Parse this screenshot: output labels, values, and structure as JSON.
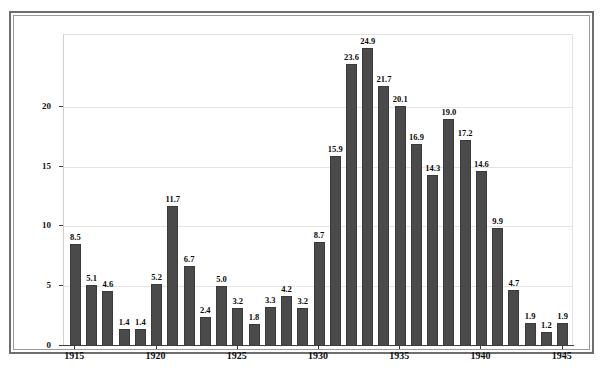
{
  "chart_data": {
    "type": "bar",
    "title": "",
    "subtitle": "",
    "xlabel": "",
    "ylabel": "Percent unemployed",
    "ylim": [
      0,
      26
    ],
    "xlim": [
      1914.3,
      1945.7
    ],
    "grid": true,
    "legend": null,
    "bar_color": "#4a4a4a",
    "categories": [
      "1915",
      "1916",
      "1917",
      "1918",
      "1919",
      "1920",
      "1921",
      "1922",
      "1923",
      "1924",
      "1925",
      "1926",
      "1927",
      "1928",
      "1929",
      "1930",
      "1931",
      "1932",
      "1933",
      "1934",
      "1935",
      "1936",
      "1937",
      "1938",
      "1939",
      "1940",
      "1941",
      "1942",
      "1943",
      "1944",
      "1945"
    ],
    "values": [
      8.5,
      5.1,
      4.6,
      1.4,
      1.4,
      5.2,
      11.7,
      6.7,
      2.4,
      5.0,
      3.2,
      1.8,
      3.3,
      4.2,
      3.2,
      8.7,
      15.9,
      23.6,
      24.9,
      21.7,
      20.1,
      16.9,
      14.3,
      19.0,
      17.2,
      14.6,
      9.9,
      4.7,
      1.9,
      1.2,
      1.9
    ],
    "data_labels": [
      "8.5",
      "5.1",
      "4.6",
      "1.4",
      "1.4",
      "5.2",
      "11.7",
      "6.7",
      "2.4",
      "5.0",
      "3.2",
      "1.8",
      "3.3",
      "4.2",
      "3.2",
      "8.7",
      "15.9",
      "23.6",
      "24.9",
      "21.7",
      "20.1",
      "16.9",
      "14.3",
      "19.0",
      "17.2",
      "14.6",
      "9.9",
      "4.7",
      "1.9",
      "1.2",
      "1.9"
    ],
    "yticks": [
      0,
      5,
      10,
      15,
      20
    ],
    "ytick_labels": [
      "0",
      "5",
      "10",
      "15",
      "20"
    ],
    "xticks": [
      1915,
      1920,
      1925,
      1930,
      1935,
      1940,
      1945
    ],
    "xtick_labels": [
      "1915",
      "1920",
      "1925",
      "1930",
      "1935",
      "1940",
      "1945"
    ]
  }
}
